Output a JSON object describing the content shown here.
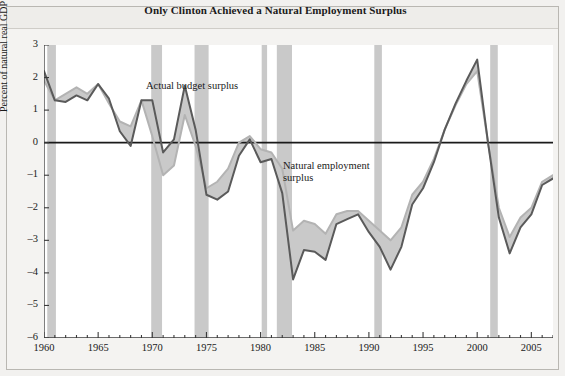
{
  "figure": {
    "title": "Only Clinton Achieved a Natural Employment Surplus",
    "background_color": "#f2f1ef",
    "plot_background_color": "#ffffff",
    "frame_color": "#b9b7b2"
  },
  "annotations": {
    "actual": "Actual budget surplus",
    "natural": "Natural employment\nsurplus"
  },
  "axes": {
    "ylabel": "Percent of natural real GDP",
    "yticks": [
      "3",
      "2",
      "1",
      "0",
      "-1",
      "-2",
      "-3",
      "-4",
      "-5",
      "-6"
    ],
    "xticks": [
      "1960",
      "1965",
      "1970",
      "1975",
      "1980",
      "1985",
      "1990",
      "1995",
      "2000",
      "2005"
    ]
  },
  "chart_data": {
    "type": "line",
    "title": "Only Clinton Achieved a Natural Employment Surplus",
    "xlabel": "",
    "ylabel": "Percent of natural real GDP",
    "xlim": [
      1960,
      2007
    ],
    "ylim": [
      -6,
      3
    ],
    "grid": false,
    "legend": "inline-annotations",
    "zero_line": true,
    "zero_line_color": "#1a1a1a",
    "series_colors": {
      "actual_budget_surplus": "#5a5a5a",
      "natural_employment_surplus": "#b3b3b3",
      "fill_between": "#c9c9c9"
    },
    "x": [
      1960,
      1961,
      1962,
      1963,
      1964,
      1965,
      1966,
      1967,
      1968,
      1969,
      1970,
      1971,
      1972,
      1973,
      1974,
      1975,
      1976,
      1977,
      1978,
      1979,
      1980,
      1981,
      1982,
      1983,
      1984,
      1985,
      1986,
      1987,
      1988,
      1989,
      1990,
      1991,
      1992,
      1993,
      1994,
      1995,
      1996,
      1997,
      1998,
      1999,
      2000,
      2001,
      2002,
      2003,
      2004,
      2005,
      2006,
      2007
    ],
    "series": [
      {
        "name": "Actual budget surplus",
        "color": "#5a5a5a",
        "values": [
          2.2,
          1.3,
          1.25,
          1.45,
          1.3,
          1.8,
          1.35,
          0.35,
          -0.1,
          1.3,
          1.3,
          -0.3,
          0.1,
          1.75,
          0.4,
          -1.6,
          -1.75,
          -1.5,
          -0.4,
          0.1,
          -0.6,
          -0.5,
          -1.55,
          -4.2,
          -3.3,
          -3.35,
          -3.6,
          -2.5,
          -2.35,
          -2.2,
          -2.75,
          -3.2,
          -3.9,
          -3.2,
          -1.9,
          -1.4,
          -0.6,
          0.4,
          1.2,
          1.9,
          2.55,
          0.0,
          -2.3,
          -3.4,
          -2.6,
          -2.2,
          -1.3,
          -1.1
        ]
      },
      {
        "name": "Natural employment surplus",
        "color": "#b3b3b3",
        "values": [
          1.9,
          1.3,
          1.5,
          1.7,
          1.5,
          1.8,
          1.2,
          0.65,
          0.5,
          1.3,
          0.2,
          -1.0,
          -0.7,
          0.85,
          -0.1,
          -1.4,
          -1.2,
          -0.8,
          0.0,
          0.2,
          -0.2,
          -0.3,
          -0.8,
          -2.7,
          -2.4,
          -2.5,
          -2.8,
          -2.2,
          -2.1,
          -2.1,
          -2.4,
          -2.7,
          -3.0,
          -2.6,
          -1.6,
          -1.2,
          -0.5,
          0.4,
          1.15,
          1.8,
          2.2,
          0.0,
          -2.0,
          -2.9,
          -2.3,
          -2.0,
          -1.2,
          -1.0
        ]
      }
    ],
    "recession_bands": [
      {
        "start": 1960.3,
        "end": 1961.1
      },
      {
        "start": 1969.9,
        "end": 1970.9
      },
      {
        "start": 1973.9,
        "end": 1975.2
      },
      {
        "start": 1980.1,
        "end": 1980.6
      },
      {
        "start": 1981.5,
        "end": 1982.9
      },
      {
        "start": 1990.5,
        "end": 1991.2
      },
      {
        "start": 2001.2,
        "end": 2001.9
      }
    ],
    "recession_band_color": "#c9c9c9"
  }
}
